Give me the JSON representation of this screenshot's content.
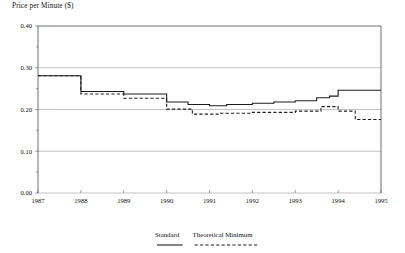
{
  "chart_data": {
    "type": "line",
    "title": "",
    "ylabel": "Price per Minute ($)",
    "xlabel": "",
    "ylim": [
      0.0,
      0.4
    ],
    "xlim": [
      1987,
      1995
    ],
    "grid": true,
    "legend_position": "bottom",
    "ytick_labels": [
      "0.40",
      "0.30",
      "0.20",
      "0.10",
      "0.00"
    ],
    "ytick_values": [
      0.4,
      0.3,
      0.2,
      0.1,
      0.0
    ],
    "xtick_labels": [
      "1987",
      "1988",
      "1989",
      "1990",
      "1991",
      "1992",
      "1993",
      "1994",
      "1995"
    ],
    "xtick_values": [
      1987,
      1988,
      1989,
      1990,
      1991,
      1992,
      1993,
      1994,
      1995
    ],
    "series": [
      {
        "name": "Standard",
        "style": "solid",
        "color": "#1c1c1c",
        "x": [
          1987.0,
          1988.0,
          1988.0,
          1989.0,
          1989.0,
          1990.0,
          1990.0,
          1990.5,
          1990.5,
          1991.0,
          1991.0,
          1991.4,
          1991.4,
          1992.0,
          1992.0,
          1992.5,
          1992.5,
          1993.0,
          1993.0,
          1993.5,
          1993.5,
          1993.8,
          1993.8,
          1994.0,
          1994.0,
          1995.0
        ],
        "y": [
          0.281,
          0.281,
          0.243,
          0.243,
          0.237,
          0.237,
          0.218,
          0.218,
          0.212,
          0.212,
          0.209,
          0.209,
          0.212,
          0.212,
          0.215,
          0.215,
          0.218,
          0.218,
          0.221,
          0.221,
          0.228,
          0.228,
          0.232,
          0.232,
          0.246,
          0.246
        ]
      },
      {
        "name": "Theoretical Minimum",
        "style": "dashed",
        "color": "#1c1c1c",
        "x": [
          1987.0,
          1988.0,
          1988.0,
          1989.0,
          1989.0,
          1990.0,
          1990.0,
          1990.6,
          1990.6,
          1991.2,
          1991.2,
          1992.0,
          1992.0,
          1993.0,
          1993.0,
          1993.6,
          1993.6,
          1994.0,
          1994.0,
          1994.4,
          1994.4,
          1995.0
        ],
        "y": [
          0.281,
          0.281,
          0.237,
          0.237,
          0.227,
          0.227,
          0.201,
          0.201,
          0.189,
          0.189,
          0.191,
          0.191,
          0.193,
          0.193,
          0.196,
          0.196,
          0.207,
          0.207,
          0.196,
          0.196,
          0.176,
          0.176
        ]
      }
    ]
  },
  "legend": {
    "items": [
      {
        "label": "Standard",
        "style": "solid"
      },
      {
        "label": "Theoretical Minimum",
        "style": "dashed"
      }
    ]
  }
}
